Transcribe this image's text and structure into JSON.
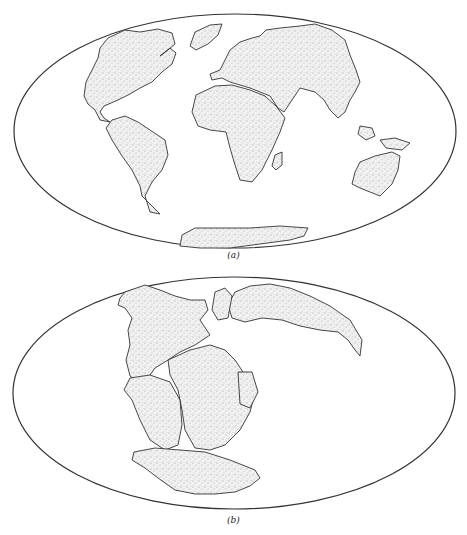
{
  "figure": {
    "panels": [
      {
        "id": "a",
        "label": "(a)",
        "description": "Present-day continents on an elliptical world projection"
      },
      {
        "id": "b",
        "label": "(b)",
        "description": "Continents reassembled into the supercontinent Pangaea"
      }
    ],
    "colors": {
      "outline": "#333333",
      "land_fill": "#efefef",
      "stipple": "#555555",
      "background": "#ffffff"
    }
  }
}
